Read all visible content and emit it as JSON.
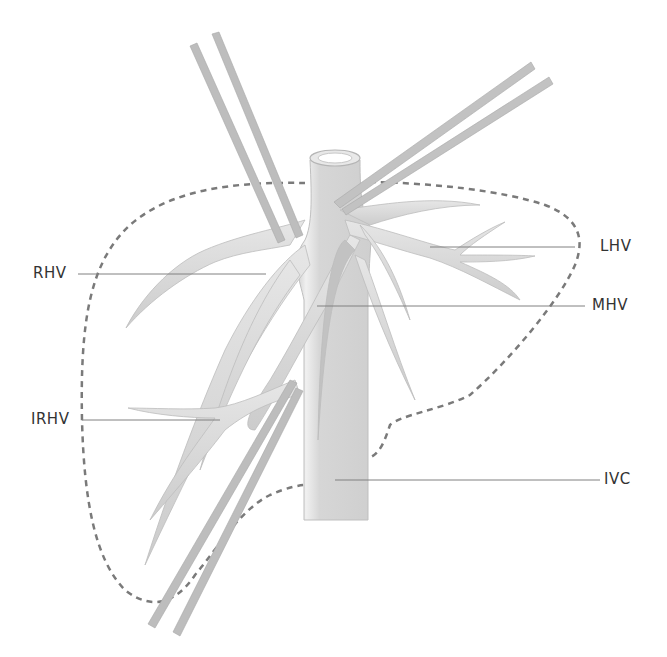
{
  "diagram": {
    "colors": {
      "vessel_fill": "#d9d9d9",
      "vessel_shade": "#c4c4c4",
      "vessel_highlight": "#f2f2f2",
      "tape_fill": "#bdbdbd",
      "outline_dash": "#7a7a7a",
      "leader_line": "#808080",
      "label_text": "#333333"
    },
    "labels": {
      "rhv": "RHV",
      "lhv": "LHV",
      "mhv": "MHV",
      "irhv": "IRHV",
      "ivc": "IVC"
    }
  }
}
